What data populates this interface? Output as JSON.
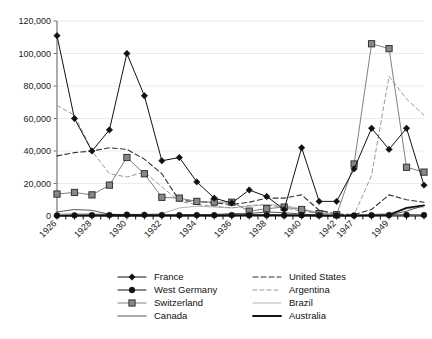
{
  "chart_data": {
    "type": "line",
    "title": "",
    "subtitle": "",
    "xlabel": "",
    "ylabel": "",
    "ylim": [
      0,
      120000
    ],
    "ytick_labels": [
      "0",
      "20,000",
      "40,000",
      "60,000",
      "80,000",
      "100,000",
      "120,000"
    ],
    "ytick_values": [
      0,
      20000,
      40000,
      60000,
      80000,
      100000,
      120000
    ],
    "grid": true,
    "legend_position": "bottom",
    "x": [
      "1926",
      "1927",
      "1928",
      "1929",
      "1930",
      "1931",
      "1932",
      "1933",
      "1934",
      "1935",
      "1936",
      "1937",
      "1938",
      "1939",
      "1940",
      "1941",
      "1942",
      "1947",
      "1948",
      "1949",
      "1950",
      "1951"
    ],
    "xtick_labels": [
      "1926",
      "1928",
      "1930",
      "1932",
      "1934",
      "1936",
      "1938",
      "1940",
      "1942",
      "1947",
      "1949"
    ],
    "xtick_label_positions": [
      0,
      2,
      4,
      6,
      8,
      10,
      12,
      14,
      16,
      17,
      19
    ],
    "series": [
      {
        "name": "France",
        "marker": "diamond",
        "color": "#111111",
        "style": "solid",
        "values": [
          111000,
          60000,
          40000,
          53000,
          100000,
          74000,
          34000,
          36000,
          21000,
          11000,
          8000,
          16000,
          12000,
          4000,
          42000,
          9000,
          9000,
          29000,
          54000,
          41000,
          54000,
          19000
        ]
      },
      {
        "name": "West Germany",
        "marker": "circle",
        "color": "#111111",
        "style": "solid",
        "values": [
          300,
          400,
          500,
          600,
          800,
          700,
          600,
          500,
          600,
          500,
          600,
          500,
          600,
          400,
          500,
          400,
          300,
          300,
          500,
          600,
          700,
          600
        ]
      },
      {
        "name": "Switzerland",
        "marker": "square",
        "color": "#808080",
        "style": "solid",
        "values": [
          13500,
          14500,
          13000,
          19000,
          36000,
          26000,
          11500,
          11000,
          9000,
          8500,
          8500,
          3000,
          4500,
          5500,
          4000,
          1500,
          800,
          32000,
          106000,
          103000,
          30000,
          27000
        ]
      },
      {
        "name": "Canada",
        "marker": "none",
        "color": "#444444",
        "style": "solid-thin",
        "values": [
          2500,
          4000,
          3500,
          1000,
          700,
          600,
          500,
          600,
          700,
          900,
          1500,
          1500,
          2500,
          2000,
          1200,
          600,
          400,
          300,
          400,
          600,
          3000,
          6500
        ]
      },
      {
        "name": "United States",
        "marker": "none",
        "color": "#333333",
        "style": "dashed",
        "values": [
          37000,
          39000,
          40000,
          42000,
          41000,
          35000,
          26000,
          9500,
          9000,
          8000,
          7000,
          8500,
          11000,
          11000,
          13000,
          3500,
          1200,
          900,
          4000,
          13000,
          10000,
          8500
        ]
      },
      {
        "name": "Argentina",
        "marker": "none",
        "color": "#999999",
        "style": "dashed-light",
        "values": [
          68000,
          62000,
          40000,
          26000,
          24000,
          27000,
          18000,
          9000,
          7000,
          6000,
          5000,
          6500,
          7000,
          5000,
          3000,
          1500,
          800,
          700,
          25000,
          86000,
          72000,
          62000
        ]
      },
      {
        "name": "Brazil",
        "marker": "none",
        "color": "#aaaaaa",
        "style": "solid-thin-light",
        "values": [
          1200,
          1500,
          1300,
          1200,
          1000,
          1100,
          1400,
          5000,
          6000,
          5500,
          5000,
          6000,
          7000,
          6500,
          4500,
          2000,
          900,
          700,
          900,
          1800,
          4500,
          5500
        ]
      },
      {
        "name": "Australia",
        "marker": "none",
        "color": "#111111",
        "style": "solid-bold",
        "values": [
          200,
          300,
          400,
          300,
          200,
          300,
          400,
          300,
          400,
          300,
          400,
          500,
          600,
          500,
          400,
          300,
          200,
          300,
          400,
          600,
          5000,
          6500
        ]
      }
    ]
  },
  "legend": {
    "columns": [
      [
        "France",
        "West Germany",
        "Switzerland",
        "Canada"
      ],
      [
        "United States",
        "Argentina",
        "Brazil",
        "Australia"
      ]
    ]
  }
}
